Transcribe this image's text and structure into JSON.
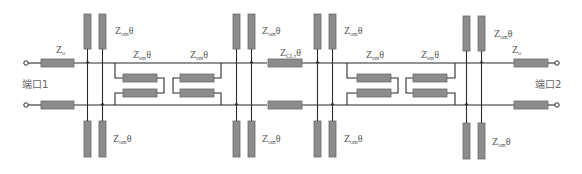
{
  "diagram": {
    "type": "transmission-line circuit schematic",
    "colors": {
      "line": "#2a2a2a",
      "element_fill": "#8c8c8c",
      "element_stroke": "#6a6a6a",
      "label": "#555555",
      "background": "#ffffff"
    },
    "ports": [
      {
        "id": "port1",
        "label": "端口1"
      },
      {
        "id": "port2",
        "label": "端口2"
      }
    ],
    "labels": {
      "z0_left": {
        "main": "Z",
        "sub": "o"
      },
      "z0_right": {
        "main": "Z",
        "sub": "o"
      },
      "stub_top_1": {
        "main": "Z",
        "sub": "om",
        "suffix": "θ"
      },
      "stub_bottom_1": {
        "main": "Z",
        "sub": "om",
        "suffix": "θ"
      },
      "stub_top_2": {
        "main": "Z",
        "sub": "om",
        "suffix": "θ"
      },
      "stub_bottom_2": {
        "main": "Z",
        "sub": "om",
        "suffix": "θ"
      },
      "stub_top_3": {
        "main": "Z",
        "sub": "om",
        "suffix": "θ"
      },
      "stub_bottom_3": {
        "main": "Z",
        "sub": "om",
        "suffix": "θ"
      },
      "stub_top_4": {
        "main": "Z",
        "sub": "om",
        "suffix": "θ"
      },
      "stub_bottom_4": {
        "main": "Z",
        "sub": "om",
        "suffix": "θ"
      },
      "coupled_1": {
        "main": "Z",
        "sub": "sm",
        "suffix": "θ"
      },
      "coupled_2": {
        "main": "Z",
        "sub": "sm",
        "suffix": "θ"
      },
      "coupled_3": {
        "main": "Z",
        "sub": "sm",
        "suffix": "θ"
      },
      "coupled_4": {
        "main": "Z",
        "sub": "sm",
        "suffix": "θ"
      },
      "center": {
        "main": "Z",
        "sub": "CL",
        "suffix": "θ"
      }
    }
  }
}
